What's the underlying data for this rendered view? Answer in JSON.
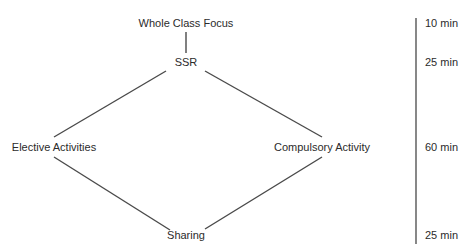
{
  "diagram": {
    "type": "flow-diamond",
    "nodes": [
      {
        "id": "whole",
        "label": "Whole Class Focus",
        "x": 186,
        "y": 23
      },
      {
        "id": "ssr",
        "label": "SSR",
        "x": 186,
        "y": 62
      },
      {
        "id": "elective",
        "label": "Elective Activities",
        "x": 54,
        "y": 147
      },
      {
        "id": "compulsory",
        "label": "Compulsory Activity",
        "x": 322,
        "y": 147
      },
      {
        "id": "sharing",
        "label": "Sharing",
        "x": 186,
        "y": 235
      }
    ],
    "edges": [
      {
        "from": "whole",
        "to": "ssr"
      },
      {
        "from": "ssr",
        "to": "elective"
      },
      {
        "from": "ssr",
        "to": "compulsory"
      },
      {
        "from": "elective",
        "to": "sharing"
      },
      {
        "from": "compulsory",
        "to": "sharing"
      }
    ],
    "timeline": {
      "durations": [
        {
          "label": "10 min",
          "y": 23
        },
        {
          "label": "25 min",
          "y": 62
        },
        {
          "label": "60 min",
          "y": 147
        },
        {
          "label": "25 min",
          "y": 235
        }
      ]
    },
    "line_color": "#4a4a4a"
  }
}
